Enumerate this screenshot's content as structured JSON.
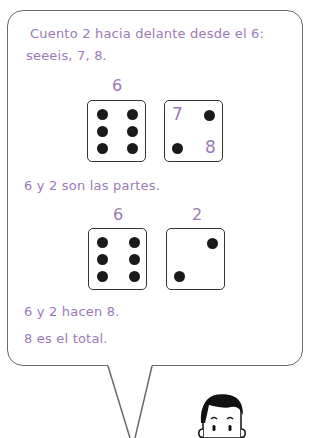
{
  "bubble": {
    "line1": "Cuento 2 hacia delante desde el 6:",
    "line2": "seeeis, 7, 8.",
    "row1": {
      "label_left": "6",
      "die_right_numbers": [
        "7",
        "8"
      ]
    },
    "parts_text": "6 y 2 son las partes.",
    "row2": {
      "label_left": "6",
      "label_right": "2"
    },
    "sum_text": "6 y 2 hacen 8.",
    "total_text": "8 es el total."
  },
  "colors": {
    "text": "#9a7ab8",
    "dot": "#1a1a1a",
    "border": "#6a6a6a"
  }
}
